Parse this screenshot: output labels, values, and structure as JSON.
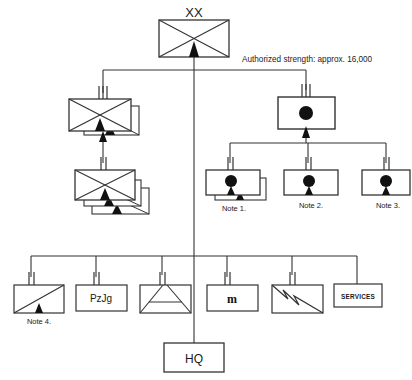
{
  "diagram": {
    "title_unit": "XX",
    "annotation": "Authorized strength: approx. 16,000",
    "hq": "HQ",
    "colors": {
      "line": "#333333",
      "fill": "#ffffff",
      "symbol": "#111111",
      "text": "#1a1a1a"
    },
    "top": {
      "echelon": "XX",
      "symbol": "infantry",
      "name": "division-box"
    },
    "branches": [
      {
        "id": "infantry-regiment",
        "echelon": "III",
        "symbol": "infantry-mountain",
        "stacked": 2,
        "label": ""
      },
      {
        "id": "artillery-regiment",
        "echelon": "III",
        "symbol": "artillery",
        "stacked": 1,
        "label": ""
      }
    ],
    "infantry_battalions": {
      "id": "infantry-battalion-group",
      "echelon": "II",
      "symbol": "infantry-mountain",
      "stacked": 3,
      "label": ""
    },
    "artillery_battalions": [
      {
        "id": "artillery-battalion-1",
        "echelon": "II",
        "symbol": "artillery-mountain",
        "stacked": 2,
        "label": "Note 1."
      },
      {
        "id": "artillery-battalion-2",
        "echelon": "II",
        "symbol": "artillery-mountain",
        "stacked": 1,
        "label": "Note 2."
      },
      {
        "id": "artillery-battalion-3",
        "echelon": "II",
        "symbol": "artillery-mountain",
        "stacked": 1,
        "label": "Note 3."
      }
    ],
    "support_units": [
      {
        "id": "reconnaissance",
        "echelon": "II",
        "symbol": "recon-mountain",
        "text": "",
        "label": "Note 4."
      },
      {
        "id": "panzerjager",
        "echelon": "II",
        "symbol": "text",
        "text": "PzJg",
        "label": ""
      },
      {
        "id": "engineer",
        "echelon": "II",
        "symbol": "engineer",
        "text": "",
        "label": ""
      },
      {
        "id": "medical",
        "echelon": "II",
        "symbol": "text-medical",
        "text": "m",
        "label": ""
      },
      {
        "id": "signals",
        "echelon": "II",
        "symbol": "signals",
        "text": "",
        "label": ""
      },
      {
        "id": "services",
        "echelon": "",
        "symbol": "text",
        "text": "SERVICES",
        "label": ""
      }
    ]
  }
}
